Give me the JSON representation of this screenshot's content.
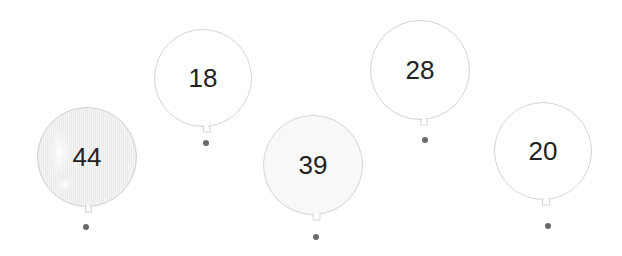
{
  "balloons": [
    {
      "value": "44",
      "cx": 87,
      "cy": 157,
      "r": 50,
      "style": "shaded",
      "dot": {
        "x": 86,
        "y": 227
      }
    },
    {
      "value": "18",
      "cx": 203,
      "cy": 78,
      "r": 49,
      "style": "plain",
      "dot": {
        "x": 206,
        "y": 143
      }
    },
    {
      "value": "39",
      "cx": 313,
      "cy": 165,
      "r": 50,
      "style": "light",
      "dot": {
        "x": 316,
        "y": 237
      }
    },
    {
      "value": "28",
      "cx": 420,
      "cy": 70,
      "r": 50,
      "style": "plain",
      "dot": {
        "x": 425,
        "y": 140
      }
    },
    {
      "value": "20",
      "cx": 543,
      "cy": 151,
      "r": 49,
      "style": "plain",
      "dot": {
        "x": 548,
        "y": 226
      }
    }
  ],
  "colors": {
    "outline": "#d4d4d4",
    "text": "#222222",
    "dot": "#6a6a6a"
  }
}
